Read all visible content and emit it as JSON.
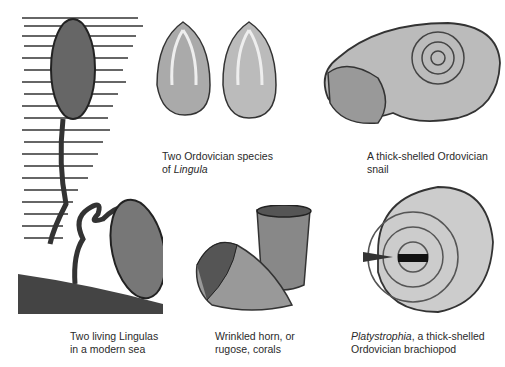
{
  "figures": [
    {
      "id": "living-lingulas",
      "caption_line1": "Two living Lingulas",
      "caption_line2": "in a modern sea"
    },
    {
      "id": "ordovician-lingula",
      "caption_line1": "Two Ordovician species",
      "caption_line2_prefix": "of ",
      "caption_line2_italic": "Lingula"
    },
    {
      "id": "ordovician-snail",
      "caption_line1": "A thick-shelled Ordovician",
      "caption_line2": "snail"
    },
    {
      "id": "rugose-corals",
      "caption_line1": "Wrinkled horn, or",
      "caption_line2": "rugose, corals"
    },
    {
      "id": "platystrophia",
      "caption_line1_italic": "Platystrophia",
      "caption_line1_rest": ", a thick-shelled",
      "caption_line2": "Ordovician brachiopod"
    }
  ]
}
